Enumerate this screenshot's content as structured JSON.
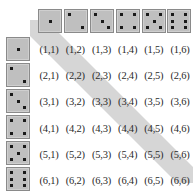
{
  "figure": {
    "name": "dice-sample-space-grid",
    "background_color": "#ffffff"
  },
  "colors": {
    "die_face": "#bfbfbf",
    "die_border": "#8a8a8a",
    "pip": "#1a1a1a",
    "highlight_band": "#d2d2d2",
    "label_text": "#2b2b2b"
  },
  "header_dice": {
    "axis_label": "second die",
    "values": [
      1,
      2,
      3,
      4,
      5,
      6
    ],
    "icon_names": [
      "die-face-1-icon",
      "die-face-2-icon",
      "die-face-3-icon",
      "die-face-4-icon",
      "die-face-5-icon",
      "die-face-6-icon"
    ]
  },
  "row_dice": {
    "axis_label": "first die",
    "values": [
      1,
      2,
      3,
      4,
      5,
      6
    ],
    "icon_names": [
      "die-face-1-icon",
      "die-face-2-icon",
      "die-face-3-icon",
      "die-face-4-icon",
      "die-face-5-icon",
      "die-face-6-icon"
    ]
  },
  "grid": {
    "rows": 6,
    "columns": 6,
    "cells": [
      [
        "(1,1)",
        "(1,2)",
        "(1,3)",
        "(1,4)",
        "(1,5)",
        "(1,6)"
      ],
      [
        "(2,1)",
        "(2,2)",
        "(2,3)",
        "(2,4)",
        "(2,5)",
        "(2,6)"
      ],
      [
        "(3,1)",
        "(3,2)",
        "(3,3)",
        "(3,4)",
        "(3,5)",
        "(3,6)"
      ],
      [
        "(4,1)",
        "(4,2)",
        "(4,3)",
        "(4,4)",
        "(4,5)",
        "(4,6)"
      ],
      [
        "(5,1)",
        "(5,2)",
        "(5,3)",
        "(5,4)",
        "(5,5)",
        "(5,6)"
      ],
      [
        "(6,1)",
        "(6,2)",
        "(6,3)",
        "(6,4)",
        "(6,5)",
        "(6,6)"
      ]
    ],
    "highlighted_cells": [
      "(1,1)",
      "(2,2)",
      "(3,3)",
      "(4,4)",
      "(5,5)",
      "(6,6)"
    ]
  }
}
